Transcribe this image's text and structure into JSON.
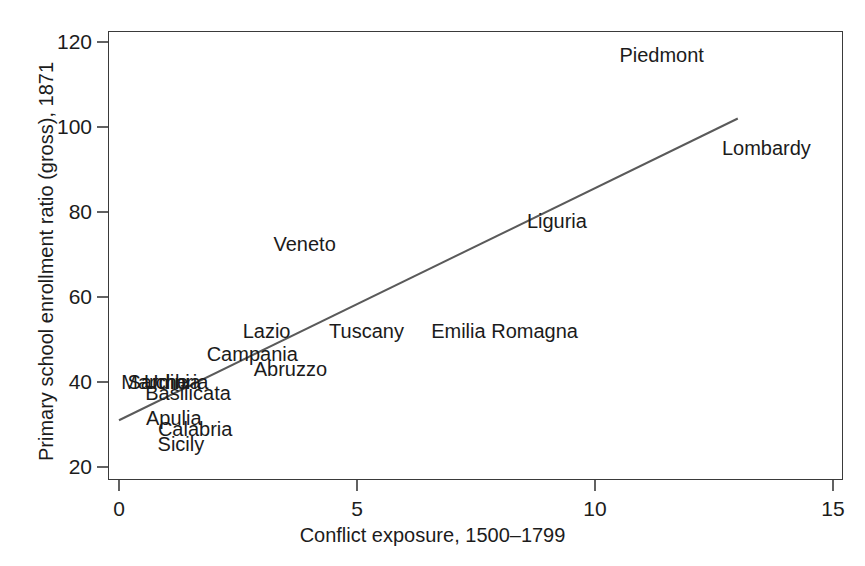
{
  "chart_data": {
    "type": "scatter",
    "title": "",
    "xlabel": "Conflict exposure, 1500–1799",
    "ylabel": "Primary school enrollment ratio (gross), 1871",
    "xlim": [
      0,
      15
    ],
    "ylim": [
      20,
      123
    ],
    "xticks": [
      "0",
      "5",
      "10",
      "15"
    ],
    "xtick_values": [
      0,
      5,
      10,
      15
    ],
    "yticks": [
      "20",
      "40",
      "60",
      "80",
      "100",
      "120"
    ],
    "ytick_values": [
      20,
      40,
      60,
      80,
      100,
      120
    ],
    "grid": false,
    "legend": null,
    "marker_style": "text-label",
    "points": [
      {
        "label": "Piedmont",
        "x": 11.4,
        "y": 117.0
      },
      {
        "label": "Lombardy",
        "x": 13.6,
        "y": 95.0
      },
      {
        "label": "Liguria",
        "x": 9.2,
        "y": 78.0
      },
      {
        "label": "Veneto",
        "x": 3.9,
        "y": 72.5
      },
      {
        "label": "Tuscany",
        "x": 5.2,
        "y": 52.0
      },
      {
        "label": "Emilia Romagna",
        "x": 8.1,
        "y": 52.0
      },
      {
        "label": "Lazio",
        "x": 3.1,
        "y": 52.0
      },
      {
        "label": "Campania",
        "x": 2.8,
        "y": 46.5
      },
      {
        "label": "Abruzzo",
        "x": 3.6,
        "y": 43.0
      },
      {
        "label": "Sardinia",
        "x": 0.95,
        "y": 40.0
      },
      {
        "label": "Marche",
        "x": 0.75,
        "y": 40.0
      },
      {
        "label": "Umbria",
        "x": 1.2,
        "y": 40.0
      },
      {
        "label": "Basilicata",
        "x": 1.45,
        "y": 37.5
      },
      {
        "label": "Apulia",
        "x": 1.15,
        "y": 31.5
      },
      {
        "label": "Calabria",
        "x": 1.6,
        "y": 29.0
      },
      {
        "label": "Sicily",
        "x": 1.3,
        "y": 25.5
      }
    ],
    "fit_line": {
      "name": "linear fit",
      "x_start": 0.0,
      "y_start": 31.0,
      "x_end": 13.0,
      "y_end": 102.0,
      "color": "#5a5a5a"
    }
  },
  "style": {
    "background": "#ffffff",
    "frame_color": "#3a3a3a",
    "text_color": "#1b1b1b",
    "line_color": "#5a5a5a"
  }
}
